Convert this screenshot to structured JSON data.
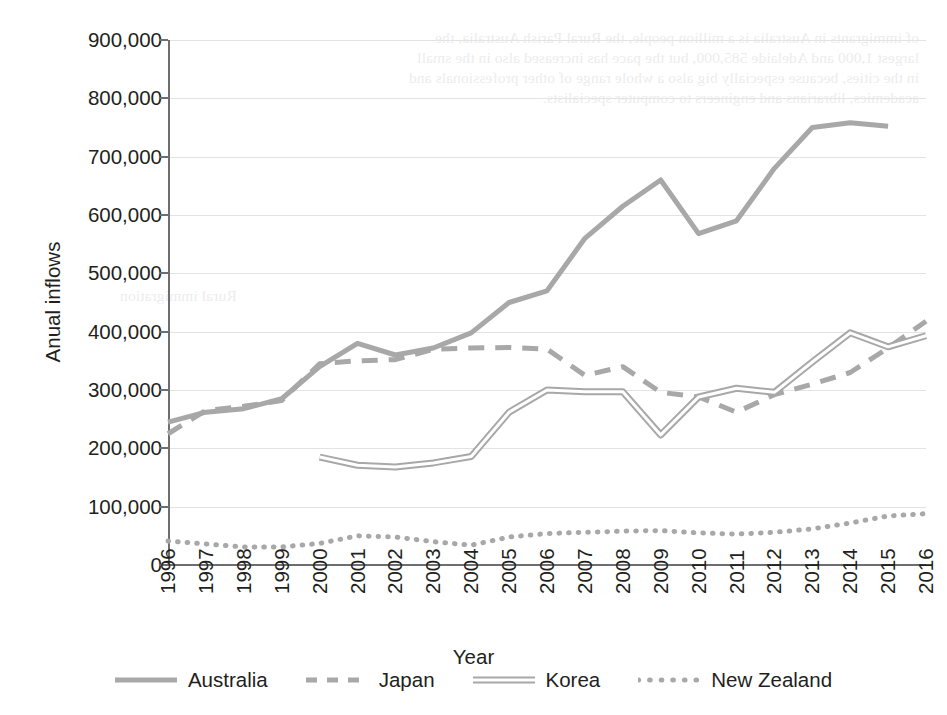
{
  "chart_data": {
    "type": "line",
    "title": "",
    "xlabel": "Year",
    "ylabel": "Anual inflows",
    "x": [
      1996,
      1997,
      1998,
      1999,
      2000,
      2001,
      2002,
      2003,
      2004,
      2005,
      2006,
      2007,
      2008,
      2009,
      2010,
      2011,
      2012,
      2013,
      2014,
      2015,
      2016
    ],
    "xlim": [
      1996,
      2016
    ],
    "ylim": [
      0,
      900000
    ],
    "yticks": [
      0,
      100000,
      200000,
      300000,
      400000,
      500000,
      600000,
      700000,
      800000,
      900000
    ],
    "ytick_labels": [
      "0",
      "100,000",
      "200,000",
      "300,000",
      "400,000",
      "500,000",
      "600,000",
      "700,000",
      "800,000",
      "900,000"
    ],
    "xtick_labels": [
      "1996",
      "1997",
      "1998",
      "1999",
      "2000",
      "2001",
      "2002",
      "2003",
      "2004",
      "2005",
      "2006",
      "2007",
      "2008",
      "2009",
      "2010",
      "2011",
      "2012",
      "2013",
      "2014",
      "2015",
      "2016"
    ],
    "grid": true,
    "legend_position": "bottom",
    "series": [
      {
        "name": "Australia",
        "style": "solid",
        "color": "#a8a8a8",
        "x": [
          1996,
          1997,
          1998,
          1999,
          2000,
          2001,
          2002,
          2003,
          2004,
          2005,
          2006,
          2007,
          2008,
          2009,
          2010,
          2011,
          2012,
          2013,
          2014,
          2015
        ],
        "values": [
          245000,
          262000,
          268000,
          285000,
          340000,
          380000,
          360000,
          372000,
          398000,
          450000,
          470000,
          560000,
          615000,
          660000,
          568000,
          590000,
          680000,
          750000,
          758000,
          752000
        ]
      },
      {
        "name": "Japan",
        "style": "dashed",
        "color": "#a8a8a8",
        "x": [
          1996,
          1997,
          1998,
          1999,
          2000,
          2001,
          2002,
          2003,
          2004,
          2005,
          2006,
          2007,
          2008,
          2009,
          2010,
          2011,
          2012,
          2013,
          2014,
          2015,
          2016
        ],
        "values": [
          225000,
          265000,
          272000,
          282000,
          345000,
          350000,
          352000,
          370000,
          372000,
          373000,
          370000,
          325000,
          340000,
          296000,
          288000,
          262000,
          292000,
          310000,
          330000,
          372000,
          418000
        ]
      },
      {
        "name": "Korea",
        "style": "double",
        "color": "#a8a8a8",
        "x": [
          2000,
          2001,
          2002,
          2003,
          2004,
          2005,
          2006,
          2007,
          2008,
          2009,
          2010,
          2011,
          2012,
          2013,
          2014,
          2015,
          2016
        ],
        "values": [
          185000,
          171000,
          168000,
          175000,
          186000,
          262000,
          300000,
          297000,
          297000,
          223000,
          288000,
          303000,
          296000,
          348000,
          398000,
          374000,
          393000
        ]
      },
      {
        "name": "New Zealand",
        "style": "dotted",
        "color": "#a8a8a8",
        "x": [
          1996,
          1997,
          1998,
          1999,
          2000,
          2001,
          2002,
          2003,
          2004,
          2005,
          2006,
          2007,
          2008,
          2009,
          2010,
          2011,
          2012,
          2013,
          2014,
          2015,
          2016
        ],
        "values": [
          41000,
          36000,
          31000,
          31000,
          37000,
          50000,
          48000,
          40000,
          34000,
          48000,
          54000,
          56000,
          58000,
          59000,
          55000,
          53000,
          56000,
          62000,
          72000,
          84000,
          88000
        ]
      }
    ]
  },
  "axis": {
    "y_title": "Anual inflows",
    "x_title": "Year"
  },
  "legend": {
    "items": [
      {
        "label": "Australia",
        "style": "solid"
      },
      {
        "label": "Japan",
        "style": "dashed"
      },
      {
        "label": "Korea",
        "style": "double"
      },
      {
        "label": "New Zealand",
        "style": "dotted"
      }
    ]
  },
  "bleed_through": {
    "top_lines": [
      "of immigrants in Australia is a million people, the Rural Parish Australia, the",
      "largest 1,000 and Adelaide 585,000, but the pace has increased also in the small",
      "in the cities, because especially big also a whole range of other professionals and",
      "academics, librarians and engineers to computer specialists."
    ],
    "mid_line": "Rural immigration"
  }
}
